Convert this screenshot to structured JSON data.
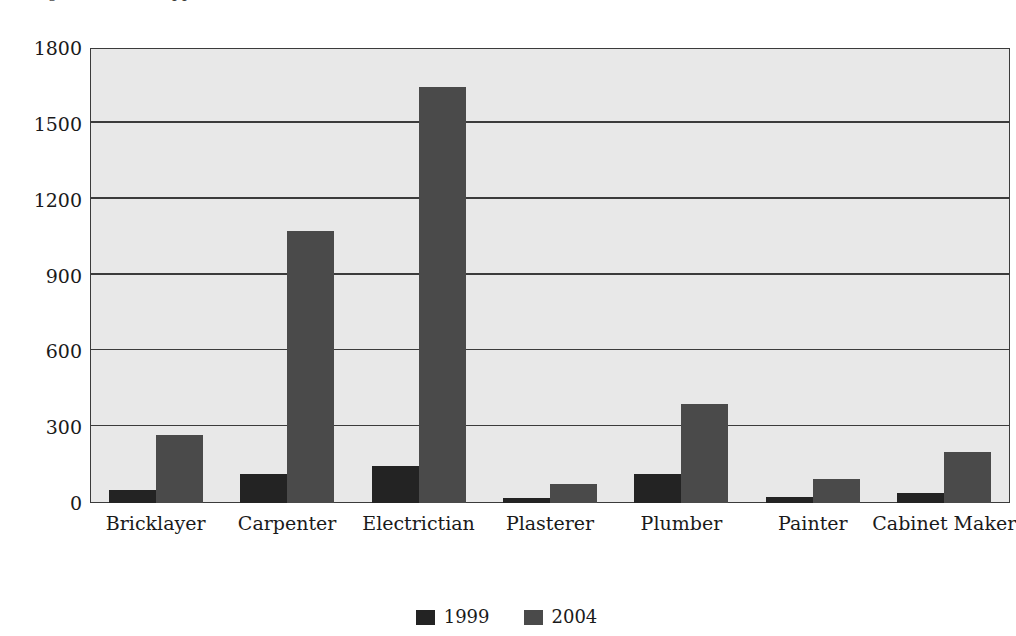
{
  "clipped_caption": {
    "fragment_left": "g",
    "fragment_right": "pp"
  },
  "chart_data": {
    "type": "bar",
    "title": "",
    "subtitle": "",
    "xlabel": "",
    "ylabel": "",
    "categories": [
      "Bricklayer",
      "Carpenter",
      "Electrictian",
      "Plasterer",
      "Plumber",
      "Painter",
      "Cabinet Maker"
    ],
    "series": [
      {
        "name": "1999",
        "color": "#232323",
        "values": [
          50,
          115,
          145,
          20,
          115,
          25,
          40
        ]
      },
      {
        "name": "2004",
        "color": "#4a4a4a",
        "values": [
          270,
          1075,
          1645,
          75,
          390,
          95,
          200
        ]
      }
    ],
    "ylim": [
      0,
      1800
    ],
    "ytick_labels": [
      "0",
      "300",
      "600",
      "900",
      "1200",
      "1500",
      "1800"
    ],
    "ytick_values": [
      0,
      300,
      600,
      900,
      1200,
      1500,
      1800
    ],
    "grid": true,
    "grid_axis": "y",
    "legend_position": "bottom-center",
    "legend_entries": [
      "1999",
      "2004"
    ],
    "plot_background": "#e8e8e8",
    "axis_color": "#3b3b3b"
  }
}
